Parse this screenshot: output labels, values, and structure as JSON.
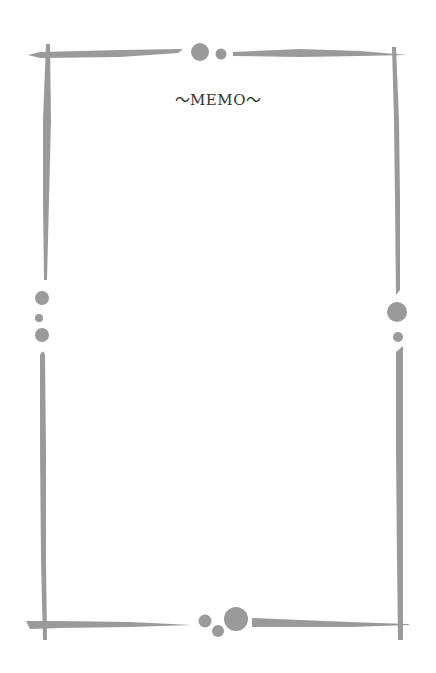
{
  "memo": {
    "title": "～MEMO～"
  },
  "colors": {
    "frame": "#9a9a9a",
    "background": "#ffffff",
    "title_text": "#333333"
  }
}
